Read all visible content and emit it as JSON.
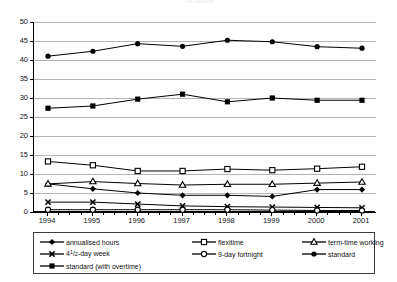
{
  "title": "Variance",
  "chart_data": {
    "type": "line",
    "title": "Variance",
    "xlabel": "",
    "ylabel": "",
    "x": [
      "1994",
      "1995",
      "1996",
      "1997",
      "1998",
      "1999",
      "2000",
      "2001"
    ],
    "categories": [
      "1994",
      "1995",
      "1996",
      "1997",
      "1998",
      "1999",
      "2000",
      "2001"
    ],
    "ylim": [
      0,
      50
    ],
    "yticks": [
      0,
      5,
      10,
      15,
      20,
      25,
      30,
      35,
      40,
      45,
      50
    ],
    "grid": true,
    "legend_position": "bottom",
    "series": [
      {
        "name": "annualised hours",
        "marker": "filled-diamond",
        "values": [
          7.4,
          6.1,
          5.0,
          4.4,
          4.4,
          4.1,
          5.9,
          5.9
        ]
      },
      {
        "name": "flexitime",
        "marker": "open-square",
        "values": [
          13.3,
          12.3,
          10.8,
          10.8,
          11.3,
          11.0,
          11.4,
          11.9
        ]
      },
      {
        "name": "term-time working",
        "marker": "open-triangle",
        "values": [
          7.4,
          8.0,
          7.5,
          7.1,
          7.3,
          7.3,
          7.6,
          7.9
        ]
      },
      {
        "name": "4½-day week",
        "marker": "cross-x",
        "values": [
          2.6,
          2.6,
          2.1,
          1.6,
          1.4,
          1.3,
          1.2,
          1.1
        ]
      },
      {
        "name": "9-day fortnight",
        "marker": "open-circle",
        "values": [
          0.6,
          0.6,
          0.6,
          0.6,
          0.6,
          0.5,
          0.4,
          0.4
        ]
      },
      {
        "name": "standard",
        "marker": "filled-circle",
        "values": [
          41.0,
          42.3,
          44.3,
          43.6,
          45.2,
          44.8,
          43.5,
          43.1
        ]
      },
      {
        "name": "standard (with overtime)",
        "marker": "filled-square",
        "values": [
          27.3,
          27.9,
          29.7,
          31.0,
          29.0,
          30.0,
          29.4,
          29.4
        ]
      }
    ]
  },
  "legend": {
    "entries": [
      {
        "label": "annualised hours",
        "marker": "filled-diamond"
      },
      {
        "label": "flexitime",
        "marker": "open-square"
      },
      {
        "label": "term-time working",
        "marker": "open-triangle"
      },
      {
        "label": "4½-day week",
        "marker": "cross-x"
      },
      {
        "label": "9-day fortnight",
        "marker": "open-circle"
      },
      {
        "label": "standard",
        "marker": "filled-circle"
      },
      {
        "label": "standard (with overtime)",
        "marker": "filled-square"
      }
    ]
  },
  "colors": {
    "line": "#000000",
    "grid": "#b4b4b4",
    "axis": "#000000",
    "text": "#111111",
    "background": "#ffffff"
  }
}
